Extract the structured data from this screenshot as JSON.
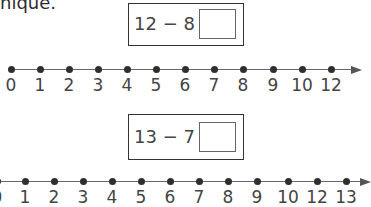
{
  "header": {
    "partial_text": "nique."
  },
  "problems": [
    {
      "equation": "12 − 8 =",
      "answer": "",
      "number_line": {
        "labels": [
          "0",
          "1",
          "2",
          "3",
          "4",
          "5",
          "6",
          "7",
          "8",
          "9",
          "10",
          "12"
        ],
        "x": [
          11,
          40,
          69,
          98,
          127,
          156,
          185,
          214,
          243,
          273,
          302,
          331
        ]
      }
    },
    {
      "equation": "13 − 7 =",
      "answer": "",
      "number_line": {
        "labels": [
          "0",
          "1",
          "2",
          "3",
          "4",
          "5",
          "6",
          "7",
          "8",
          "9",
          "10",
          "12",
          "13"
        ],
        "x": [
          -3,
          25,
          54,
          83,
          112,
          141,
          170,
          199,
          228,
          257,
          288,
          317,
          346
        ]
      }
    }
  ]
}
